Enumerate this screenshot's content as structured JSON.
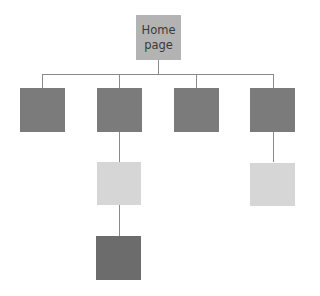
{
  "diagram": {
    "type": "site-map-hierarchy",
    "colors": {
      "home": "#b3b3b3",
      "level1": "#7b7b7b",
      "level2": "#d6d6d6",
      "level3": "#6c6c6c",
      "connector": "#8a8a8a"
    },
    "root": {
      "label_line1": "Home",
      "label_line2": "page"
    },
    "level1": [
      {
        "id": "section-1",
        "label": ""
      },
      {
        "id": "section-2",
        "label": ""
      },
      {
        "id": "section-3",
        "label": ""
      },
      {
        "id": "section-4",
        "label": ""
      }
    ],
    "level2": [
      {
        "id": "subpage-2a",
        "parent": "section-2",
        "label": ""
      },
      {
        "id": "subpage-4a",
        "parent": "section-4",
        "label": ""
      }
    ],
    "level3": [
      {
        "id": "subpage-2a-i",
        "parent": "subpage-2a",
        "label": ""
      }
    ]
  }
}
